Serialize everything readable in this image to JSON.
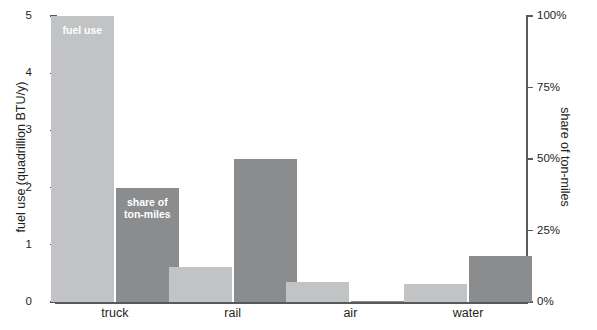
{
  "chart_data": {
    "type": "bar",
    "title": "",
    "subtitle": "",
    "categories": [
      "truck",
      "rail",
      "air",
      "water"
    ],
    "series": [
      {
        "name": "fuel use",
        "axis": "left",
        "unit": "quadrillion BTU/y",
        "color": "#c2c3c4",
        "values": [
          5.0,
          0.62,
          0.35,
          0.32
        ]
      },
      {
        "name": "share of ton-miles",
        "axis": "right",
        "unit": "%",
        "color": "#8b8c8e",
        "values": [
          40,
          50,
          0.5,
          16
        ]
      }
    ],
    "left_axis": {
      "label": "fuel use (quadrillion BTU/y)",
      "ticks": [
        "0",
        "1",
        "2",
        "3",
        "4",
        "5"
      ],
      "tick_values": [
        0,
        1,
        2,
        3,
        4,
        5
      ],
      "ylim": [
        0,
        5
      ]
    },
    "right_axis": {
      "label": "share of ton-miles",
      "ticks": [
        "0%",
        "25%",
        "50%",
        "75%",
        "100%"
      ],
      "tick_values": [
        0,
        25,
        50,
        75,
        100
      ],
      "ylim": [
        0,
        100
      ]
    },
    "xlabel": "",
    "grid": false,
    "legend": "in-bar annotations on truck group",
    "annotations": [
      {
        "text": "fuel use",
        "target": "truck-fuel-bar"
      },
      {
        "text": "share of\nton-miles",
        "target": "truck-share-bar"
      }
    ]
  },
  "annotations": {
    "fuel_use": "fuel use",
    "share_line1": "share of",
    "share_line2": "ton-miles"
  },
  "colors": {
    "fuel_bar": "#c2c3c4",
    "share_bar": "#8b8c8e",
    "axis": "#58595b",
    "text": "#231f20",
    "annotation_text": "#ffffff",
    "background": "#ffffff"
  }
}
